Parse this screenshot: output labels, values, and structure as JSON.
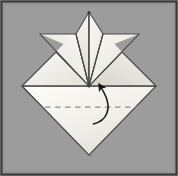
{
  "figure": {
    "kind": "origami-instruction-diagram",
    "canvas": {
      "width": 178,
      "height": 176
    },
    "colors": {
      "background": "#9c9c9c",
      "border": "#3a3a3a",
      "paper_light": "#f4f3ee",
      "paper_mid": "#e6e5de",
      "paper_shade": "#dcdbd3",
      "paper_shade_deep": "#cfcec6",
      "crease_line": "#4a4a4a",
      "fold_line_dashed": "#8a8f86",
      "arrow": "#1c1c1c",
      "drop_shadow": "#161616"
    },
    "geometry": {
      "center_point": {
        "x": 89,
        "y": 86
      },
      "diamond_top": {
        "x": 89,
        "y": 47
      },
      "diamond_left": {
        "x": 22,
        "y": 86
      },
      "diamond_right": {
        "x": 156,
        "y": 86
      },
      "diamond_bottom": {
        "x": 89,
        "y": 155
      },
      "fan_peak": {
        "x": 89,
        "y": 12
      },
      "fan_left_tip": {
        "x": 40,
        "y": 34
      },
      "fan_right_tip": {
        "x": 139,
        "y": 34
      },
      "dashed_fold_y": 107,
      "dashed_fold_x_start": 45,
      "dashed_fold_x_end": 137
    },
    "elements": {
      "fold_line_label": "valley fold line",
      "arrow_label": "fold-up arrow",
      "petal_count": 4,
      "shadow_label": "paper drop shadow"
    }
  }
}
